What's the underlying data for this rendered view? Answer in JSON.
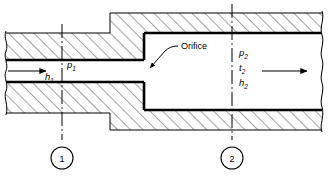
{
  "figure": {
    "type": "engineering-cross-section",
    "callouts": {
      "orifice_label": "Orifice"
    },
    "station_1": {
      "number": "1",
      "labels": [
        {
          "symbol": "h",
          "subscript": "1"
        },
        {
          "symbol": "p",
          "subscript": "1"
        }
      ]
    },
    "station_2": {
      "number": "2",
      "labels": [
        {
          "symbol": "p",
          "subscript": "2"
        },
        {
          "symbol": "t",
          "subscript": "2"
        },
        {
          "symbol": "h",
          "subscript": "2"
        }
      ]
    },
    "flow": {
      "inlet_arrow": "flow-arrow-right",
      "outlet_arrow": "flow-arrow-right"
    },
    "colors": {
      "line": "#000000",
      "hatch": "#555555",
      "background": "#ffffff"
    }
  }
}
